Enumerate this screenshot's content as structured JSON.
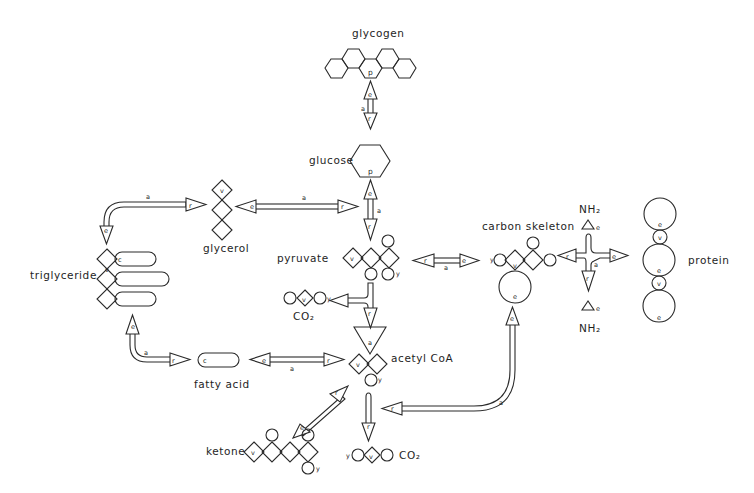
{
  "diagram": {
    "type": "metabolic-pathway-schematic",
    "nodes": {
      "glycogen": {
        "label": "glycogen",
        "marker": "p"
      },
      "glucose": {
        "label": "glucose",
        "marker": "p"
      },
      "glycerol": {
        "label": "glycerol",
        "marker": "v"
      },
      "triglyceride": {
        "label": "triglyceride",
        "markers": [
          "v",
          "c"
        ]
      },
      "pyruvate": {
        "label": "pyruvate",
        "markers": [
          "v",
          "y"
        ]
      },
      "co2_top": {
        "label": "CO₂",
        "markers": [
          "v",
          "y"
        ]
      },
      "acetyl_coa": {
        "label": "acetyl CoA",
        "markers": [
          "a",
          "v",
          "y"
        ]
      },
      "fatty_acid": {
        "label": "fatty acid",
        "marker": "c"
      },
      "ketone": {
        "label": "ketone",
        "markers": [
          "v",
          "y"
        ]
      },
      "co2_bottom": {
        "label": "CO₂",
        "markers": [
          "y",
          "v"
        ]
      },
      "carbon_skeleton": {
        "label": "carbon skeleton",
        "markers": [
          "y",
          "v",
          "e"
        ]
      },
      "nh2_top": {
        "label": "NH₂",
        "marker": "e"
      },
      "nh2_bottom": {
        "label": "NH₂",
        "marker": "e"
      },
      "protein": {
        "label": "protein",
        "markers": [
          "e",
          "v"
        ]
      }
    },
    "arrow_labels": {
      "a": "a",
      "e": "e",
      "r": "r"
    },
    "edges": [
      {
        "from": "glycogen",
        "to": "glucose",
        "labels": [
          "e",
          "a",
          "r"
        ]
      },
      {
        "from": "glucose",
        "to": "pyruvate",
        "labels": [
          "e",
          "a",
          "r"
        ]
      },
      {
        "from": "glycerol",
        "to": "pyruvate",
        "labels": [
          "e",
          "a",
          "r"
        ]
      },
      {
        "from": "glycerol",
        "to": "triglyceride",
        "labels": [
          "r",
          "a",
          "e"
        ]
      },
      {
        "from": "triglyceride",
        "to": "fatty_acid",
        "labels": [
          "e",
          "a",
          "r"
        ]
      },
      {
        "from": "fatty_acid",
        "to": "acetyl_coa",
        "labels": [
          "e",
          "a",
          "r"
        ]
      },
      {
        "from": "pyruvate",
        "to": "acetyl_coa",
        "labels": [
          "r"
        ],
        "side_product": "co2_top"
      },
      {
        "from": "pyruvate",
        "to": "carbon_skeleton",
        "labels": [
          "r",
          "a",
          "e"
        ]
      },
      {
        "from": "acetyl_coa",
        "to": "ketone",
        "labels": [
          "r",
          "e"
        ]
      },
      {
        "from": "acetyl_coa",
        "to": "co2_bottom",
        "labels": [
          "r"
        ]
      },
      {
        "from": "carbon_skeleton",
        "to": "acetyl_coa",
        "labels": [
          "e",
          "a",
          "r"
        ]
      },
      {
        "from": "carbon_skeleton",
        "to": "protein",
        "labels": [
          "r",
          "a",
          "e",
          "r"
        ]
      }
    ]
  }
}
